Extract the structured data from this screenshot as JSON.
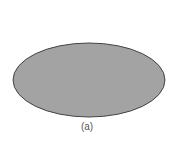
{
  "figure": {
    "shape": "ellipse",
    "fill": "#a3a3a3",
    "stroke": "#444444",
    "caption": "(a)"
  }
}
